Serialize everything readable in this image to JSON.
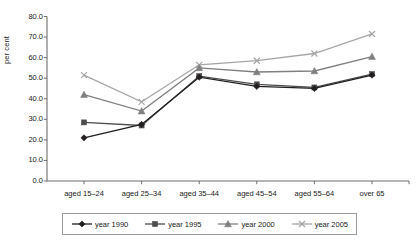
{
  "chart_data": {
    "type": "line",
    "title": "",
    "xlabel": "",
    "ylabel": "per cent",
    "ylim": [
      0.0,
      80.0
    ],
    "ytick_step": 10.0,
    "grid": false,
    "legend_position": "bottom",
    "categories": [
      "aged 15–24",
      "aged 25–34",
      "aged 35–44",
      "aged 45–54",
      "aged 55–64",
      "over 65"
    ],
    "ytick_labels": [
      "80.0",
      "70.0",
      "60.0",
      "50.0",
      "40.0",
      "30.0",
      "20.0",
      "10.0",
      "0.0"
    ],
    "ytick_values": [
      80.0,
      70.0,
      60.0,
      50.0,
      40.0,
      30.0,
      20.0,
      10.0,
      0.0
    ],
    "series": [
      {
        "name": "year 1990",
        "color": "#231f20",
        "marker": "diamond",
        "values": [
          21.0,
          27.5,
          50.5,
          46.0,
          45.0,
          51.5
        ]
      },
      {
        "name": "year 1995",
        "color": "#4d4d4d",
        "marker": "square",
        "values": [
          28.5,
          27.0,
          51.0,
          47.0,
          45.5,
          52.0
        ]
      },
      {
        "name": "year 2000",
        "color": "#808080",
        "marker": "triangle",
        "values": [
          42.0,
          34.0,
          55.0,
          53.0,
          53.5,
          60.5
        ]
      },
      {
        "name": "year 2005",
        "color": "#a6a6a6",
        "marker": "cross",
        "values": [
          51.5,
          38.5,
          56.5,
          58.5,
          62.0,
          71.5
        ]
      }
    ]
  },
  "legend": {
    "items": [
      {
        "label": "year 1990"
      },
      {
        "label": "year 1995"
      },
      {
        "label": "year 2000"
      },
      {
        "label": "year 2005"
      }
    ]
  }
}
